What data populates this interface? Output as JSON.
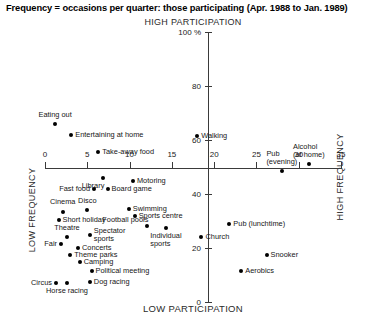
{
  "chart_data": {
    "type": "scatter",
    "title": "Frequency = occasions per quarter: those participating (Apr. 1988 to Jan. 1989)",
    "top_caption": "HIGH PARTICIPATION",
    "bottom_caption": "LOW PARTICIPATION",
    "left_caption": "LOW FREQUENCY",
    "right_caption": "HIGH FREQUENCY",
    "xlabel": "",
    "ylabel": "",
    "xlim": [
      0,
      35
    ],
    "ylim": [
      0,
      100
    ],
    "grid": false,
    "legend": "none",
    "x_ticks": [
      "0",
      "5",
      "10",
      "15",
      "20",
      "25",
      "30",
      "35"
    ],
    "x_tick_values": [
      0,
      5,
      10,
      15,
      20,
      25,
      30,
      35
    ],
    "y_ticks": [
      "100 %",
      "80",
      "60",
      "40",
      "20",
      "0"
    ],
    "y_tick_values": [
      100,
      80,
      60,
      40,
      20,
      0
    ],
    "points": [
      {
        "label": "Eating out",
        "x": 1.2,
        "y": 66.0,
        "pos": "above"
      },
      {
        "label": "Entertaining at home",
        "x": 3.1,
        "y": 62.0,
        "pos": "right"
      },
      {
        "label": "Take-away food",
        "x": 6.3,
        "y": 55.5,
        "pos": "right"
      },
      {
        "label": "Walking",
        "x": 18.0,
        "y": 61.5,
        "pos": "right"
      },
      {
        "label": "Pub\n(evening)",
        "x": 28.0,
        "y": 48.5,
        "pos": "above"
      },
      {
        "label": "Alcohol\n(at home)",
        "x": 31.2,
        "y": 51.0,
        "pos": "above"
      },
      {
        "label": "Library",
        "x": 6.9,
        "y": 46.0,
        "pos": "below-left"
      },
      {
        "label": "Motoring",
        "x": 10.4,
        "y": 45.0,
        "pos": "right"
      },
      {
        "label": "Fast food",
        "x": 5.8,
        "y": 42.0,
        "pos": "left"
      },
      {
        "label": "Board game",
        "x": 7.4,
        "y": 42.0,
        "pos": "right"
      },
      {
        "label": "Cinema",
        "x": 2.1,
        "y": 33.5,
        "pos": "above"
      },
      {
        "label": "Disco",
        "x": 5.0,
        "y": 34.0,
        "pos": "above"
      },
      {
        "label": "Swimming",
        "x": 9.9,
        "y": 34.5,
        "pos": "right"
      },
      {
        "label": "Sports centre",
        "x": 10.6,
        "y": 32.0,
        "pos": "right"
      },
      {
        "label": "Short holiday",
        "x": 1.6,
        "y": 30.5,
        "pos": "right"
      },
      {
        "label": "Football pools",
        "x": 12.1,
        "y": 28.0,
        "pos": "above-left"
      },
      {
        "label": "Individual\nsports",
        "x": 14.3,
        "y": 27.5,
        "pos": "below"
      },
      {
        "label": "Theatre",
        "x": 2.6,
        "y": 24.0,
        "pos": "above"
      },
      {
        "label": "Spectator\nsports",
        "x": 5.3,
        "y": 25.0,
        "pos": "right"
      },
      {
        "label": "Church",
        "x": 18.5,
        "y": 24.0,
        "pos": "right"
      },
      {
        "label": "Pub (lunchtime)",
        "x": 21.8,
        "y": 29.0,
        "pos": "right"
      },
      {
        "label": "Fair",
        "x": 1.9,
        "y": 21.5,
        "pos": "left"
      },
      {
        "label": "Concerts",
        "x": 3.9,
        "y": 20.0,
        "pos": "right"
      },
      {
        "label": "Theme parks",
        "x": 3.0,
        "y": 17.5,
        "pos": "right"
      },
      {
        "label": "Camping",
        "x": 4.1,
        "y": 15.0,
        "pos": "right"
      },
      {
        "label": "Political meeting",
        "x": 5.5,
        "y": 11.5,
        "pos": "right"
      },
      {
        "label": "Snooker",
        "x": 26.2,
        "y": 17.5,
        "pos": "right"
      },
      {
        "label": "Aerobics",
        "x": 23.2,
        "y": 11.5,
        "pos": "right"
      },
      {
        "label": "Circus",
        "x": 1.3,
        "y": 7.0,
        "pos": "left"
      },
      {
        "label": "Horse racing",
        "x": 2.6,
        "y": 7.0,
        "pos": "below"
      },
      {
        "label": "Dog racing",
        "x": 5.3,
        "y": 7.5,
        "pos": "right"
      }
    ]
  }
}
